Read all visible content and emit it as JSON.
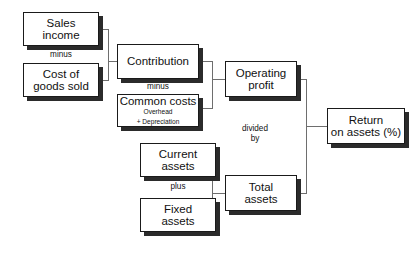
{
  "diagram": {
    "line_color": "#6e6e6e",
    "box_border_color": "#1a1a1a",
    "box_shadow_color": "#2b2b2b",
    "background_color": "#ffffff",
    "nodes": [
      {
        "id": "sales-income",
        "lines": [
          "Sales",
          "income"
        ],
        "sub_lines": [],
        "x": 23,
        "y": 12,
        "w": 76,
        "h": 34
      },
      {
        "id": "cost-of-goods-sold",
        "lines": [
          "Cost of",
          "goods sold"
        ],
        "sub_lines": [],
        "x": 23,
        "y": 63,
        "w": 76,
        "h": 34
      },
      {
        "id": "contribution",
        "lines": [
          "Contribution"
        ],
        "sub_lines": [],
        "x": 117,
        "y": 44,
        "w": 82,
        "h": 35
      },
      {
        "id": "common-costs",
        "lines": [
          "Common costs"
        ],
        "sub_lines": [
          "Overhead",
          "+ Depreciation"
        ],
        "x": 117,
        "y": 94,
        "w": 82,
        "h": 33
      },
      {
        "id": "operating-profit",
        "lines": [
          "Operating",
          "profit"
        ],
        "sub_lines": [],
        "x": 225,
        "y": 61,
        "w": 72,
        "h": 36
      },
      {
        "id": "current-assets",
        "lines": [
          "Current",
          "assets"
        ],
        "sub_lines": [],
        "x": 140,
        "y": 143,
        "w": 76,
        "h": 34
      },
      {
        "id": "fixed-assets",
        "lines": [
          "Fixed",
          "assets"
        ],
        "sub_lines": [],
        "x": 140,
        "y": 198,
        "w": 76,
        "h": 34
      },
      {
        "id": "total-assets",
        "lines": [
          "Total",
          "assets"
        ],
        "sub_lines": [],
        "x": 225,
        "y": 175,
        "w": 72,
        "h": 36
      },
      {
        "id": "return-on-assets",
        "lines": [
          "Return",
          "on assets (%)"
        ],
        "sub_lines": [],
        "x": 327,
        "y": 108,
        "w": 78,
        "h": 36
      }
    ],
    "operators": [
      {
        "id": "minus-top",
        "lines": [
          "minus"
        ],
        "x": 43,
        "y": 50,
        "w": 36
      },
      {
        "id": "minus-middle",
        "lines": [
          "minus"
        ],
        "x": 140,
        "y": 82,
        "w": 36
      },
      {
        "id": "plus",
        "lines": [
          "plus"
        ],
        "x": 160,
        "y": 182,
        "w": 36
      },
      {
        "id": "divided-by",
        "lines": [
          "divided",
          "by"
        ],
        "x": 233,
        "y": 124,
        "w": 44
      }
    ],
    "connectors": [
      {
        "id": "sales-to-contribution",
        "from": "sales-income",
        "to": "contribution",
        "points": [
          [
            99,
            29
          ],
          [
            108,
            29
          ],
          [
            108,
            61
          ],
          [
            117,
            61
          ]
        ]
      },
      {
        "id": "cogs-to-contribution",
        "from": "cost-of-goods-sold",
        "to": "contribution",
        "points": [
          [
            99,
            80
          ],
          [
            108,
            80
          ],
          [
            108,
            61
          ]
        ]
      },
      {
        "id": "contribution-to-operating-profit",
        "from": "contribution",
        "to": "operating-profit",
        "points": [
          [
            199,
            61
          ],
          [
            212,
            61
          ],
          [
            212,
            79
          ],
          [
            225,
            79
          ]
        ]
      },
      {
        "id": "common-costs-to-operating-profit",
        "from": "common-costs",
        "to": "operating-profit",
        "points": [
          [
            199,
            108
          ],
          [
            212,
            108
          ],
          [
            212,
            79
          ]
        ]
      },
      {
        "id": "current-assets-to-total-assets",
        "from": "current-assets",
        "to": "total-assets",
        "points": [
          [
            216,
            160
          ],
          [
            212,
            160
          ],
          [
            212,
            193
          ],
          [
            225,
            193
          ]
        ]
      },
      {
        "id": "fixed-assets-to-total-assets",
        "from": "fixed-assets",
        "to": "total-assets",
        "points": [
          [
            216,
            215
          ],
          [
            212,
            215
          ],
          [
            212,
            193
          ]
        ]
      },
      {
        "id": "operating-profit-to-return",
        "from": "operating-profit",
        "to": "return-on-assets",
        "points": [
          [
            297,
            79
          ],
          [
            306,
            79
          ],
          [
            306,
            126
          ],
          [
            327,
            126
          ]
        ]
      },
      {
        "id": "total-assets-to-return",
        "from": "total-assets",
        "to": "return-on-assets",
        "points": [
          [
            297,
            193
          ],
          [
            306,
            193
          ],
          [
            306,
            126
          ]
        ]
      }
    ]
  }
}
